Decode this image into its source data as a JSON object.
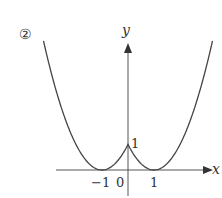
{
  "figure": {
    "label": "②",
    "function": "y = (|x| - 1)^2",
    "axes": {
      "x_label": "x",
      "y_label": "y",
      "x_ticks": [
        "-1",
        "0",
        "1"
      ],
      "y_ticks": [
        "1"
      ]
    },
    "key_points": [
      {
        "x": -1,
        "y": 0
      },
      {
        "x": 0,
        "y": 1
      },
      {
        "x": 1,
        "y": 0
      }
    ],
    "colors": {
      "curve": "#444444",
      "axis": "#555555"
    }
  },
  "text": {
    "label": "②",
    "x_axis": "x",
    "y_axis": "y",
    "tick_neg1": "−1",
    "tick_0": "0",
    "tick_1": "1",
    "tick_y1": "1"
  }
}
